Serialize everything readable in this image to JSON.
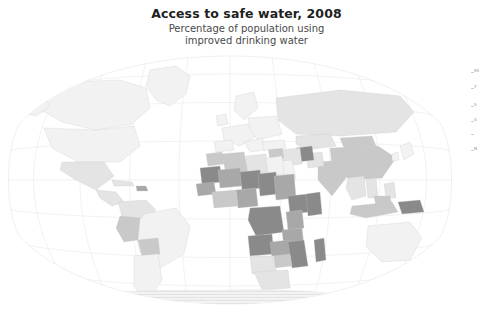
{
  "title": "Access to safe water, 2008",
  "subtitle_line1": "Percentage of population using",
  "subtitle_line2": "improved drinking water",
  "legend": {
    "ticks": [
      {
        "label": "91",
        "value": 91,
        "y": 4
      },
      {
        "label": "7",
        "value": 7,
        "y": 20
      },
      {
        "label": "5",
        "value": 5,
        "y": 38
      },
      {
        "label": "4",
        "value": 4,
        "y": 53
      },
      {
        "label": "",
        "value": null,
        "y": 66
      },
      {
        "label": "N",
        "value": null,
        "y": 82
      }
    ]
  },
  "colors": {
    "background": "#ffffff",
    "title": "#1f1f1f",
    "subtitle": "#4a4a4a",
    "graticule": "#e2e2e2",
    "border": "#c8c8c8",
    "scale_lightest": "#f2f2f2",
    "scale_light": "#e4e4e4",
    "scale_mid": "#c9c9c9",
    "scale_dark": "#a8a8a8",
    "scale_darkest": "#8a8a8a",
    "nodata": "#ececec"
  },
  "chart_data": {
    "type": "map",
    "map_projection": "winkel-tripel",
    "title": "Access to safe water, 2008",
    "subtitle": "Percentage of population using improved drinking water",
    "unit": "percent",
    "legend_position": "right",
    "grid": true,
    "nodata_pattern": "horizontal-hatch",
    "regions": [
      {
        "name": "Canada",
        "value": 100,
        "shade": "scale_lightest"
      },
      {
        "name": "United States",
        "value": 99,
        "shade": "scale_lightest"
      },
      {
        "name": "Greenland",
        "value": 100,
        "shade": "scale_lightest"
      },
      {
        "name": "Mexico",
        "value": 94,
        "shade": "scale_light"
      },
      {
        "name": "Guatemala",
        "value": 94,
        "shade": "scale_light"
      },
      {
        "name": "Cuba",
        "value": 94,
        "shade": "scale_light"
      },
      {
        "name": "Haiti",
        "value": 63,
        "shade": "scale_dark"
      },
      {
        "name": "Colombia",
        "value": 92,
        "shade": "scale_light"
      },
      {
        "name": "Venezuela",
        "value": 92,
        "shade": "scale_light"
      },
      {
        "name": "Brazil",
        "value": 97,
        "shade": "scale_lightest"
      },
      {
        "name": "Peru",
        "value": 82,
        "shade": "scale_mid"
      },
      {
        "name": "Bolivia",
        "value": 86,
        "shade": "scale_mid"
      },
      {
        "name": "Argentina",
        "value": 97,
        "shade": "scale_lightest"
      },
      {
        "name": "Chile",
        "value": 96,
        "shade": "scale_lightest"
      },
      {
        "name": "United Kingdom",
        "value": 100,
        "shade": "scale_lightest"
      },
      {
        "name": "France",
        "value": 100,
        "shade": "scale_lightest"
      },
      {
        "name": "Germany",
        "value": 100,
        "shade": "scale_lightest"
      },
      {
        "name": "Spain",
        "value": 100,
        "shade": "scale_lightest"
      },
      {
        "name": "Italy",
        "value": 100,
        "shade": "scale_lightest"
      },
      {
        "name": "Poland",
        "value": 100,
        "shade": "scale_lightest"
      },
      {
        "name": "Russia",
        "value": 96,
        "shade": "scale_light"
      },
      {
        "name": "Ukraine",
        "value": 98,
        "shade": "scale_lightest"
      },
      {
        "name": "Turkey",
        "value": 99,
        "shade": "scale_lightest"
      },
      {
        "name": "Morocco",
        "value": 81,
        "shade": "scale_mid"
      },
      {
        "name": "Algeria",
        "value": 83,
        "shade": "scale_mid"
      },
      {
        "name": "Libya",
        "value": 90,
        "shade": "scale_light"
      },
      {
        "name": "Egypt",
        "value": 99,
        "shade": "scale_lightest"
      },
      {
        "name": "Mauritania",
        "value": 49,
        "shade": "scale_darkest"
      },
      {
        "name": "Mali",
        "value": 56,
        "shade": "scale_dark"
      },
      {
        "name": "Niger",
        "value": 48,
        "shade": "scale_darkest"
      },
      {
        "name": "Chad",
        "value": 50,
        "shade": "scale_darkest"
      },
      {
        "name": "Sudan",
        "value": 57,
        "shade": "scale_dark"
      },
      {
        "name": "Nigeria",
        "value": 58,
        "shade": "scale_dark"
      },
      {
        "name": "Ethiopia",
        "value": 38,
        "shade": "scale_darkest"
      },
      {
        "name": "Somalia",
        "value": 30,
        "shade": "scale_darkest"
      },
      {
        "name": "Kenya",
        "value": 59,
        "shade": "scale_dark"
      },
      {
        "name": "Dem. Rep. Congo",
        "value": 46,
        "shade": "scale_darkest"
      },
      {
        "name": "Angola",
        "value": 50,
        "shade": "scale_darkest"
      },
      {
        "name": "Tanzania",
        "value": 54,
        "shade": "scale_dark"
      },
      {
        "name": "Mozambique",
        "value": 47,
        "shade": "scale_darkest"
      },
      {
        "name": "Madagascar",
        "value": 41,
        "shade": "scale_darkest"
      },
      {
        "name": "Zambia",
        "value": 60,
        "shade": "scale_dark"
      },
      {
        "name": "Zimbabwe",
        "value": 82,
        "shade": "scale_mid"
      },
      {
        "name": "South Africa",
        "value": 91,
        "shade": "scale_light"
      },
      {
        "name": "Namibia",
        "value": 92,
        "shade": "scale_light"
      },
      {
        "name": "Botswana",
        "value": 95,
        "shade": "scale_lightest"
      },
      {
        "name": "Saudi Arabia",
        "value": 97,
        "shade": "scale_lightest"
      },
      {
        "name": "Iran",
        "value": 94,
        "shade": "scale_light"
      },
      {
        "name": "Iraq",
        "value": 79,
        "shade": "scale_mid"
      },
      {
        "name": "Afghanistan",
        "value": 48,
        "shade": "scale_darkest"
      },
      {
        "name": "Pakistan",
        "value": 90,
        "shade": "scale_light"
      },
      {
        "name": "India",
        "value": 88,
        "shade": "scale_mid"
      },
      {
        "name": "China",
        "value": 89,
        "shade": "scale_mid"
      },
      {
        "name": "Mongolia",
        "value": 76,
        "shade": "scale_mid"
      },
      {
        "name": "Kazakhstan",
        "value": 95,
        "shade": "scale_light"
      },
      {
        "name": "Myanmar",
        "value": 71,
        "shade": "scale_mid"
      },
      {
        "name": "Thailand",
        "value": 98,
        "shade": "scale_lightest"
      },
      {
        "name": "Vietnam",
        "value": 94,
        "shade": "scale_light"
      },
      {
        "name": "Indonesia",
        "value": 80,
        "shade": "scale_mid"
      },
      {
        "name": "Philippines",
        "value": 91,
        "shade": "scale_light"
      },
      {
        "name": "Papua New Guinea",
        "value": 40,
        "shade": "scale_darkest"
      },
      {
        "name": "Australia",
        "value": 100,
        "shade": "scale_lightest"
      },
      {
        "name": "New Zealand",
        "value": 100,
        "shade": "scale_lightest"
      },
      {
        "name": "Japan",
        "value": 100,
        "shade": "scale_lightest"
      },
      {
        "name": "Antarctica",
        "value": null,
        "shade": "nodata"
      }
    ]
  }
}
